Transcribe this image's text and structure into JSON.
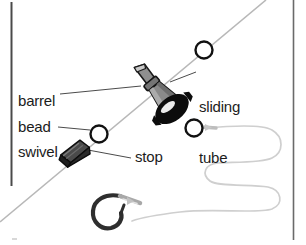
{
  "figure": {
    "background_color": "#ffffff",
    "text_color": "#1c1c1c",
    "line_color": "#b5b5b5",
    "border_color": "#4a4a4a",
    "swivel_color": "#8c8c8c",
    "tube_color": "#101010",
    "stop_color": "#2b2b2b",
    "bead_fill": "#ffffff",
    "bead_stroke": "#111111",
    "hook_color": "#2e2e2e"
  },
  "labels": {
    "barrel_swivel": "barrel\nswivel",
    "barrel_swivel_line1": "barrel",
    "barrel_swivel_line2": "swivel",
    "sliding_tube": "sliding\ntube",
    "sliding_tube_line1": "sliding",
    "sliding_tube_line2": "tube",
    "bead": "bead",
    "stop": "stop"
  },
  "parts": [
    {
      "id": "bead-upper",
      "name": "bead-upper",
      "shape": "circle",
      "cx": 204,
      "cy": 50,
      "r": 9
    },
    {
      "id": "sliding-tube",
      "name": "sliding-tube",
      "shape": "oval",
      "cx": 172,
      "cy": 109,
      "rx": 17,
      "ry": 11
    },
    {
      "id": "barrel-swivel",
      "name": "barrel-swivel",
      "shape": "barrel",
      "cx": 148,
      "cy": 90
    },
    {
      "id": "bead-lower",
      "name": "bead-lower",
      "shape": "circle",
      "cx": 99,
      "cy": 134,
      "r": 9
    },
    {
      "id": "bead-leader",
      "name": "bead-leader",
      "shape": "circle",
      "cx": 194,
      "cy": 128,
      "r": 9
    },
    {
      "id": "stop",
      "name": "stop-block",
      "shape": "block",
      "cx": 77,
      "cy": 154
    },
    {
      "id": "hook",
      "name": "fishing-hook",
      "shape": "hook",
      "cx": 110,
      "cy": 215
    }
  ],
  "main_line": {
    "name": "main-fishing-line",
    "from": [
      266,
      0
    ],
    "to": [
      0,
      222
    ]
  },
  "leader_line": {
    "name": "leader-line",
    "description": "serpentine slack leader from bead to hook"
  }
}
